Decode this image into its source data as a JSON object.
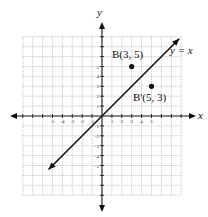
{
  "chart_data": {
    "type": "scatter",
    "title": "",
    "xlabel": "x",
    "ylabel": "y",
    "xlim": [
      -8,
      8
    ],
    "ylim": [
      -8,
      8
    ],
    "grid": true,
    "x_ticks": [
      -5,
      -4,
      -3,
      -2,
      -1,
      1,
      2,
      3,
      4,
      5
    ],
    "y_ticks": [
      -5,
      -4,
      -3,
      -2,
      -1,
      1,
      2,
      3,
      4,
      5
    ],
    "line": {
      "label": "y = x",
      "slope": 1,
      "intercept": 0,
      "from": [
        -5.4,
        -5.4
      ],
      "to": [
        7.8,
        7.8
      ]
    },
    "points": [
      {
        "name": "B",
        "label": "B(3, 5)",
        "x": 3,
        "y": 5
      },
      {
        "name": "B'",
        "label": "B'(5, 3)",
        "x": 5,
        "y": 3
      }
    ]
  },
  "labels": {
    "x_axis": "x",
    "y_axis": "y",
    "line": "y = x",
    "point_b": "B(3, 5)",
    "point_b_prime": "B'(5, 3)"
  },
  "colors": {
    "axis": "#111111",
    "grid": "#9a9a9a",
    "line": "#111111",
    "point": "#111111"
  }
}
